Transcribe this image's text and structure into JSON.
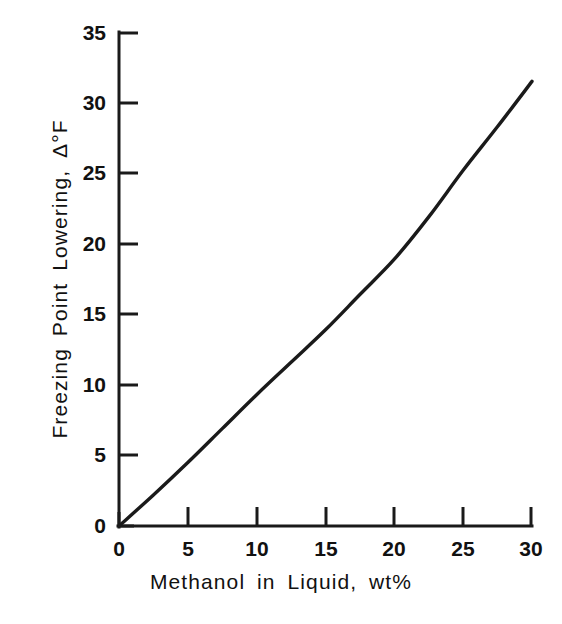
{
  "chart_data": {
    "type": "line",
    "title": "",
    "xlabel": "Methanol in Liquid, wt%",
    "ylabel": "Freezing Point Lowering, Δ°F",
    "xlim": [
      0,
      30
    ],
    "ylim": [
      0,
      35
    ],
    "xticks": [
      0,
      5,
      10,
      15,
      20,
      25,
      30
    ],
    "yticks": [
      0,
      5,
      10,
      15,
      20,
      25,
      30,
      35
    ],
    "xtick_labels": [
      "0",
      "5",
      "10",
      "15",
      "20",
      "25",
      "30"
    ],
    "ytick_labels": [
      "0",
      "5",
      "10",
      "15",
      "20",
      "25",
      "30",
      "35"
    ],
    "grid": false,
    "legend": null,
    "series": [
      {
        "name": "Freezing point lowering vs methanol concentration",
        "color": "#1a1a1a",
        "x": [
          0,
          2.5,
          5,
          7.5,
          10,
          12.5,
          15,
          17.5,
          20,
          22.5,
          25,
          27.5,
          30
        ],
        "y": [
          0.0,
          2.2,
          4.5,
          6.9,
          9.3,
          11.6,
          13.9,
          16.4,
          18.9,
          21.9,
          25.2,
          28.3,
          31.5
        ]
      }
    ],
    "axis_style": {
      "spines": [
        "left",
        "bottom"
      ],
      "tick_direction": "out",
      "line_color": "#1a1a1a",
      "background": "#ffffff"
    }
  },
  "geometry": {
    "origin_x": 119,
    "origin_y": 526,
    "x_max_px": 532,
    "y_max_px": 32
  }
}
